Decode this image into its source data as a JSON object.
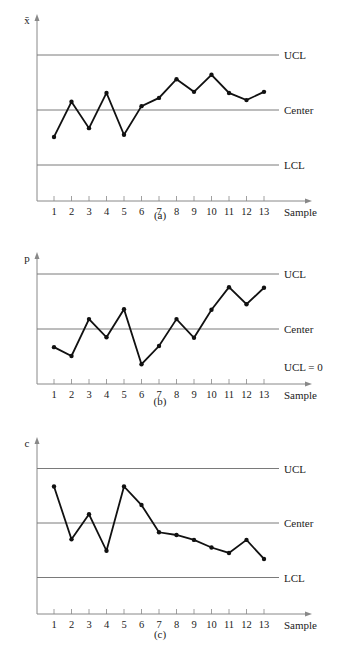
{
  "chart_data": [
    {
      "type": "line",
      "id": "a",
      "caption": "(a)",
      "ylabel": "x̄",
      "xlabel": "Sample",
      "categories": [
        1,
        2,
        3,
        4,
        5,
        6,
        7,
        8,
        9,
        10,
        11,
        12,
        13
      ],
      "values": [
        -0.49,
        0.15,
        -0.33,
        0.31,
        -0.45,
        0.07,
        0.22,
        0.56,
        0.33,
        0.64,
        0.31,
        0.18,
        0.33
      ],
      "control_lines": [
        {
          "label": "UCL",
          "value": 1
        },
        {
          "label": "Center",
          "value": 0
        },
        {
          "label": "LCL",
          "value": -1
        }
      ],
      "ylim": [
        -1.65,
        1.5
      ],
      "grid": false
    },
    {
      "type": "line",
      "id": "b",
      "caption": "(b)",
      "ylabel": "p",
      "xlabel": "Sample",
      "categories": [
        1,
        2,
        3,
        4,
        5,
        6,
        7,
        8,
        9,
        10,
        11,
        12,
        13
      ],
      "values": [
        -0.33,
        -0.49,
        0.18,
        -0.15,
        0.36,
        -0.64,
        -0.31,
        0.18,
        -0.16,
        0.35,
        0.76,
        0.45,
        0.75
      ],
      "control_lines": [
        {
          "label": "UCL",
          "value": 1
        },
        {
          "label": "Center",
          "value": 0
        },
        {
          "label": "UCL = 0",
          "value": -1
        }
      ],
      "ylim": [
        -1,
        1.4
      ],
      "grid": false
    },
    {
      "type": "line",
      "id": "c",
      "caption": "(c)",
      "ylabel": "c",
      "xlabel": "Sample",
      "categories": [
        1,
        2,
        3,
        4,
        5,
        6,
        7,
        8,
        9,
        10,
        11,
        12,
        13
      ],
      "values": [
        0.67,
        -0.3,
        0.16,
        -0.51,
        0.67,
        0.33,
        -0.17,
        -0.22,
        -0.31,
        -0.45,
        -0.55,
        -0.31,
        -0.66
      ],
      "control_lines": [
        {
          "label": "UCL",
          "value": 1
        },
        {
          "label": "Center",
          "value": 0
        },
        {
          "label": "LCL",
          "value": -1
        }
      ],
      "ylim": [
        -1.65,
        1.6
      ],
      "grid": false
    }
  ],
  "charts": {
    "a": {
      "ylabel": "x̄",
      "xlabel": "Sample",
      "caption": "(a)",
      "ucl": "UCL",
      "center": "Center",
      "lcl": "LCL"
    },
    "b": {
      "ylabel": "p",
      "xlabel": "Sample",
      "caption": "(b)",
      "ucl": "UCL",
      "center": "Center",
      "lcl": "UCL = 0"
    },
    "c": {
      "ylabel": "c",
      "xlabel": "Sample",
      "caption": "(c)",
      "ucl": "UCL",
      "center": "Center",
      "lcl": "LCL"
    }
  },
  "colors": {
    "line": "#111111",
    "control": "#7a7a7a",
    "axis": "#888888"
  }
}
